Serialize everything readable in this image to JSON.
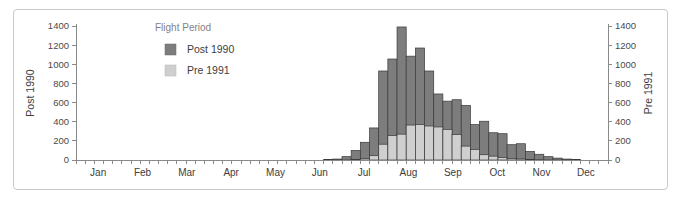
{
  "chart_data": {
    "type": "bar",
    "title": "",
    "subtitle": "",
    "xlabel": "",
    "ylabel_left": "Post 1990",
    "ylabel_right": "Pre 1991",
    "grid": false,
    "legend_position": "upper-left-inside",
    "legend_title": "Flight Period",
    "ylim": [
      0,
      1400
    ],
    "y_ticks": [
      0,
      200,
      400,
      600,
      800,
      1000,
      1200,
      1400
    ],
    "y_tick_labels": [
      "0",
      "200",
      "400",
      "600",
      "800",
      "1000",
      "1200",
      "1400"
    ],
    "right_ylim": [
      0,
      1400
    ],
    "right_y_ticks": [
      0,
      200,
      400,
      600,
      800,
      1000,
      1200,
      1400
    ],
    "right_y_tick_labels": [
      "0",
      "200",
      "400",
      "600",
      "800",
      "1000",
      "1200",
      "1400"
    ],
    "month_labels": [
      "Jan",
      "Feb",
      "Mar",
      "Apr",
      "May",
      "Jun",
      "Jul",
      "Aug",
      "Sep",
      "Oct",
      "Nov",
      "Dec"
    ],
    "x_description": "Week of year (half-month intervals), Jan through Dec",
    "n_bins": 58,
    "series": [
      {
        "name": "Post 1990",
        "color": "#7d7d7d",
        "values": [
          0,
          0,
          0,
          0,
          0,
          0,
          0,
          0,
          0,
          0,
          0,
          0,
          0,
          0,
          0,
          0,
          0,
          0,
          0,
          0,
          0,
          0,
          0,
          0,
          0,
          0,
          0,
          5,
          10,
          35,
          100,
          185,
          335,
          930,
          1055,
          1390,
          1085,
          1170,
          930,
          690,
          615,
          630,
          570,
          370,
          405,
          285,
          275,
          160,
          170,
          90,
          60,
          35,
          20,
          10,
          5,
          0,
          0,
          0
        ]
      },
      {
        "name": "Pre 1991",
        "color": "#cfcfcf",
        "values": [
          0,
          0,
          0,
          0,
          0,
          0,
          0,
          0,
          0,
          0,
          0,
          0,
          0,
          0,
          0,
          0,
          0,
          0,
          0,
          0,
          0,
          0,
          0,
          0,
          0,
          0,
          0,
          0,
          0,
          0,
          5,
          15,
          45,
          165,
          255,
          270,
          365,
          370,
          355,
          345,
          320,
          265,
          145,
          110,
          55,
          40,
          25,
          15,
          12,
          5,
          2,
          0,
          0,
          0,
          0,
          0,
          0,
          0
        ]
      }
    ]
  },
  "colors": {
    "bar_post": "#7d7d7d",
    "bar_pre": "#cfcfcf",
    "bar_outline": "#3a3a3a",
    "axis": "#8a8a8a",
    "text": "#3d3d3d",
    "muted_text": "#828282",
    "frame": "#c9c9c9",
    "background": "#ffffff"
  }
}
